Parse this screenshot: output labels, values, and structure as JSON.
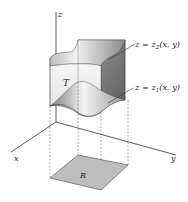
{
  "figure": {
    "axes": {
      "x_label": "x",
      "y_label": "y",
      "z_label": "z"
    },
    "surfaces": {
      "upper": {
        "lhs": "z = z",
        "sub": "2",
        "rhs": "(x, y)"
      },
      "lower": {
        "lhs": "z = z",
        "sub": "1",
        "rhs": "(x, y)"
      }
    },
    "solid_label": "T",
    "region_label": "R",
    "colors": {
      "surface_dark": "#6e6e6e",
      "surface_light": "#e6e6e6",
      "region_fill": "#b9b9b9",
      "line": "#333333"
    }
  }
}
